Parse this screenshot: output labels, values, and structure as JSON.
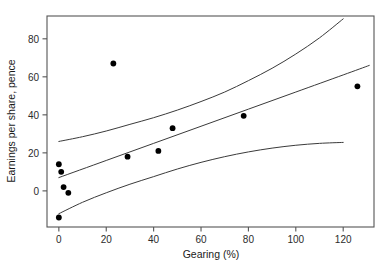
{
  "chart_data": {
    "type": "scatter",
    "title": "",
    "xlabel": "Gearing (%)",
    "ylabel": "Earnings per share, pence",
    "xlim": [
      -5,
      133
    ],
    "ylim": [
      -19,
      92
    ],
    "xticks": [
      0,
      20,
      40,
      60,
      80,
      100,
      120
    ],
    "xtick_labels": [
      "0",
      "20",
      "40",
      "60",
      "80",
      "100",
      "120"
    ],
    "yticks": [
      0,
      20,
      40,
      60,
      80
    ],
    "ytick_labels": [
      "0",
      "20",
      "40",
      "60",
      "80"
    ],
    "grid": false,
    "legend": false,
    "marker": "filled-circle",
    "marker_color": "#000000",
    "line_color": "#3a3a3a",
    "frame_color": "#555555",
    "points": [
      {
        "x": 0,
        "y": 14.0
      },
      {
        "x": 1,
        "y": 10.0
      },
      {
        "x": 2,
        "y": 2.0
      },
      {
        "x": 4,
        "y": -1.0
      },
      {
        "x": 0,
        "y": -14.0
      },
      {
        "x": 23,
        "y": 67.0
      },
      {
        "x": 29,
        "y": 18.0
      },
      {
        "x": 42,
        "y": 21.0
      },
      {
        "x": 48,
        "y": 33.0
      },
      {
        "x": 78,
        "y": 39.5
      },
      {
        "x": 126,
        "y": 55.0
      }
    ],
    "series": [
      {
        "name": "upper-confidence-band",
        "x": [
          0,
          10,
          20,
          30,
          40,
          50,
          60,
          70,
          80,
          90,
          100,
          110,
          120
        ],
        "values": [
          26.0,
          28.5,
          31.5,
          35.0,
          38.5,
          42.5,
          47.0,
          52.0,
          58.0,
          64.5,
          72.0,
          80.5,
          90.5
        ]
      },
      {
        "name": "fitted-regression-line",
        "x": [
          0,
          20,
          40,
          60,
          80,
          100,
          120,
          131
        ],
        "values": [
          7.0,
          16.0,
          25.0,
          34.0,
          43.0,
          52.0,
          61.0,
          66.0
        ]
      },
      {
        "name": "lower-confidence-band",
        "x": [
          0,
          10,
          20,
          30,
          40,
          50,
          60,
          70,
          80,
          90,
          100,
          110,
          120
        ],
        "values": [
          -12.0,
          -6.0,
          -1.0,
          3.5,
          7.5,
          11.5,
          15.0,
          18.0,
          20.5,
          22.5,
          24.0,
          25.0,
          25.5
        ]
      }
    ]
  }
}
